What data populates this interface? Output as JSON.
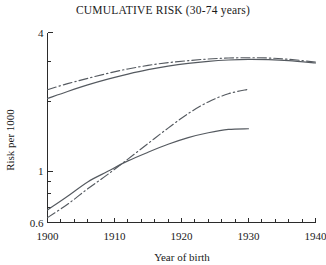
{
  "chart_data": {
    "type": "line",
    "title": "CUMULATIVE RISK (30-74 years)",
    "xlabel": "Year of birth",
    "ylabel": "Risk per 1000",
    "xlim": [
      1900,
      1940
    ],
    "ylim": [
      0.6,
      4
    ],
    "yscale": "log",
    "xscale": "linear",
    "grid": false,
    "legend": "none",
    "xticks_major": [
      1900,
      1910,
      1920,
      1930,
      1940
    ],
    "xtick_labels": [
      "1900",
      "1910",
      "1920",
      "1930",
      "1940"
    ],
    "xticks_minor_step": 2,
    "yticks_major": [
      0.6,
      1,
      4
    ],
    "ytick_labels": [
      "0.6",
      "1",
      "4"
    ],
    "yticks_minor": [
      0.7,
      0.8,
      0.9,
      2,
      3
    ],
    "series": [
      {
        "name": "upper-dash-dot",
        "style": "dash-dot",
        "color": "#555a60",
        "x": [
          1900,
          1903,
          1906,
          1909,
          1912,
          1915,
          1918,
          1921,
          1924,
          1927,
          1930,
          1933,
          1936,
          1940
        ],
        "values": [
          2.26,
          2.4,
          2.53,
          2.66,
          2.78,
          2.88,
          2.96,
          3.02,
          3.07,
          3.1,
          3.11,
          3.1,
          3.06,
          2.98
        ]
      },
      {
        "name": "upper-solid",
        "style": "solid",
        "color": "#555a60",
        "x": [
          1900,
          1903,
          1906,
          1909,
          1912,
          1915,
          1918,
          1921,
          1924,
          1927,
          1930,
          1933,
          1936,
          1940
        ],
        "values": [
          2.07,
          2.22,
          2.37,
          2.51,
          2.64,
          2.76,
          2.86,
          2.94,
          3.0,
          3.04,
          3.06,
          3.05,
          3.02,
          2.95
        ]
      },
      {
        "name": "lower-dash-dot",
        "style": "dash-dot",
        "color": "#555a60",
        "x": [
          1900,
          1903,
          1906,
          1909,
          1912,
          1915,
          1918,
          1921,
          1924,
          1927,
          1930
        ],
        "values": [
          0.63,
          0.72,
          0.84,
          0.97,
          1.13,
          1.32,
          1.54,
          1.78,
          2.0,
          2.17,
          2.27
        ]
      },
      {
        "name": "lower-solid",
        "style": "solid",
        "color": "#555a60",
        "x": [
          1900,
          1903,
          1906,
          1909,
          1912,
          1915,
          1918,
          1921,
          1924,
          1927,
          1930
        ],
        "values": [
          0.68,
          0.78,
          0.9,
          1.0,
          1.11,
          1.21,
          1.31,
          1.4,
          1.47,
          1.52,
          1.53
        ]
      }
    ]
  },
  "colors": {
    "axis": "#2b2b2b",
    "series": "#555a60",
    "background": "#ffffff"
  }
}
